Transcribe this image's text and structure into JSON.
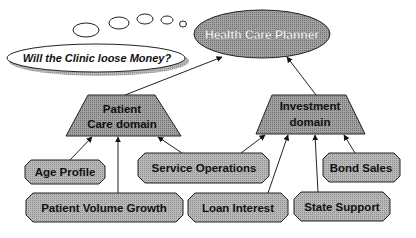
{
  "diagram": {
    "root": {
      "label": "Health Care Planner"
    },
    "thought": {
      "label": "Will the Clinic loose Money?"
    },
    "domains": [
      {
        "id": "patient",
        "line1": "Patient",
        "line2": "Care domain"
      },
      {
        "id": "investment",
        "line1": "Investment",
        "line2": "domain"
      }
    ],
    "factors": [
      {
        "label": "Age Profile",
        "parent": "patient"
      },
      {
        "label": "Service Operations",
        "parent": "patient"
      },
      {
        "label": "Bond Sales",
        "parent": "investment"
      },
      {
        "label": "Patient Volume Growth",
        "parent": "patient"
      },
      {
        "label": "Loan Interest",
        "parent": "investment"
      },
      {
        "label": "State Support",
        "parent": "investment"
      }
    ],
    "colors": {
      "shape_fill": "#b4b4b4",
      "domain_fill": "#9a9a9a",
      "stroke": "#222222",
      "background": "#ffffff"
    }
  }
}
